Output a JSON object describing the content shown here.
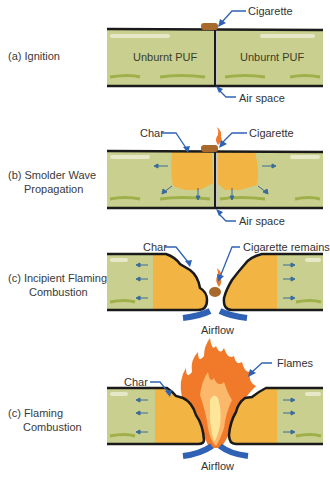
{
  "colors": {
    "foam": "#c9cf8e",
    "foam_light": "#e3e6c2",
    "foam_streak": "#9fb04a",
    "char": "#f2b544",
    "outline": "#1a1a1a",
    "arrow_blue": "#2f62b5",
    "flame_orange": "#f07a2a",
    "flame_yellow": "#fde59a",
    "cigarette": "#a86a2c"
  },
  "panels": [
    {
      "id": "a",
      "caption": "(a) Ignition",
      "inner_left": "Unburnt PUF",
      "inner_right": "Unburnt PUF",
      "callouts": [
        "Cigarette",
        "Air space"
      ]
    },
    {
      "id": "b",
      "caption_line1": "(b) Smolder Wave",
      "caption_line2": "Propagation",
      "callouts": [
        "Char",
        "Cigarette",
        "Air space"
      ]
    },
    {
      "id": "c1",
      "caption_line1": "(c) Incipient Flaming",
      "caption_line2": "Combustion",
      "callouts": [
        "Char",
        "Cigarette remains",
        "Airflow"
      ]
    },
    {
      "id": "c2",
      "caption_line1": "(c) Flaming",
      "caption_line2": "Combustion",
      "callouts": [
        "Char",
        "Flames",
        "Airflow"
      ]
    }
  ]
}
